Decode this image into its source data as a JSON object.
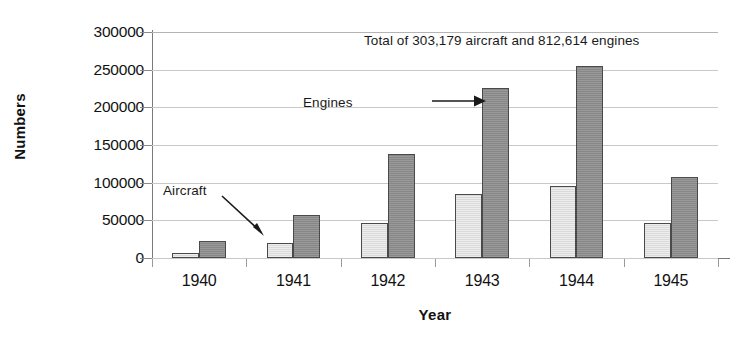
{
  "chart_data": {
    "type": "bar",
    "title": "",
    "xlabel": "Year",
    "ylabel": "Numbers",
    "categories": [
      "1940",
      "1941",
      "1942",
      "1943",
      "1944",
      "1945"
    ],
    "series": [
      {
        "name": "Aircraft",
        "color": "#dedede",
        "values": [
          6000,
          19500,
          47000,
          85500,
          95000,
          46000
        ]
      },
      {
        "name": "Engines",
        "color": "#8e8e8e",
        "values": [
          23000,
          57000,
          138000,
          226000,
          255000,
          108000
        ]
      }
    ],
    "ylim": [
      0,
      300000
    ],
    "ytick_labels": [
      "300000",
      "250000",
      "200000",
      "150000",
      "100000",
      "50000",
      "0"
    ],
    "ytick_values": [
      300000,
      250000,
      200000,
      150000,
      100000,
      50000,
      0
    ],
    "grid": true,
    "legend_position": "none",
    "annotations": [
      {
        "id": "total",
        "text": "Total of 303,179  aircraft and 812,614 engines"
      },
      {
        "id": "engines",
        "text": "Engines"
      },
      {
        "id": "aircraft",
        "text": "Aircraft"
      }
    ]
  }
}
